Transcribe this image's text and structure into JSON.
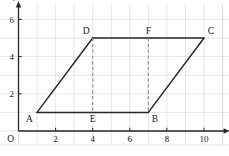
{
  "figure": {
    "axes": {
      "x_label": "x",
      "y_label": "y",
      "origin_label": "O",
      "x_ticks": [
        "2",
        "4",
        "6",
        "8",
        "10"
      ],
      "y_ticks": [
        "2",
        "4",
        "6"
      ],
      "x_tick_values": [
        2,
        4,
        6,
        8,
        10
      ],
      "y_tick_values": [
        2,
        4,
        6
      ],
      "x_range": [
        0,
        11.3
      ],
      "y_range": [
        0,
        6.8
      ],
      "grid": true,
      "grid_step": 1,
      "grid_color": "#cfcfcf",
      "axis_color": "#262626"
    },
    "vertices": [
      {
        "name": "A",
        "x": 1,
        "y": 1,
        "label": "A",
        "label_pos": "below-left"
      },
      {
        "name": "B",
        "x": 7,
        "y": 1,
        "label": "B",
        "label_pos": "below-right"
      },
      {
        "name": "C",
        "x": 10,
        "y": 5,
        "label": "C",
        "label_pos": "above-right"
      },
      {
        "name": "D",
        "x": 4,
        "y": 5,
        "label": "D",
        "label_pos": "above-left"
      },
      {
        "name": "E",
        "x": 4,
        "y": 1,
        "label": "E",
        "label_pos": "below"
      },
      {
        "name": "F",
        "x": 7,
        "y": 5,
        "label": "F",
        "label_pos": "above"
      }
    ],
    "solid_edges": [
      {
        "from": "A",
        "to": "B"
      },
      {
        "from": "B",
        "to": "C"
      },
      {
        "from": "C",
        "to": "D"
      },
      {
        "from": "D",
        "to": "A"
      }
    ],
    "dashed_segments": [
      {
        "from": "D",
        "to": "E"
      },
      {
        "from": "F",
        "to": "B"
      }
    ],
    "shape_color": "#262626",
    "dashed_color": "#8a8a8a"
  },
  "chart_data": {
    "type": "scatter",
    "xlabel": "x",
    "ylabel": "y",
    "xlim": [
      0,
      11.3
    ],
    "ylim": [
      0,
      6.8
    ],
    "grid": true,
    "x_ticks": [
      2,
      4,
      6,
      8,
      10
    ],
    "y_ticks": [
      2,
      4,
      6
    ],
    "series": [
      {
        "name": "Parallelogram ABCD (solid outline)",
        "x": [
          1,
          7,
          10,
          4,
          1
        ],
        "y": [
          1,
          1,
          5,
          5,
          1
        ],
        "style": "solid"
      },
      {
        "name": "Altitude DE (dashed)",
        "x": [
          4,
          4
        ],
        "y": [
          5,
          1
        ],
        "style": "dashed"
      },
      {
        "name": "Altitude FB (dashed)",
        "x": [
          7,
          7
        ],
        "y": [
          5,
          1
        ],
        "style": "dashed"
      }
    ],
    "annotations": [
      {
        "text": "A",
        "x": 1,
        "y": 1
      },
      {
        "text": "B",
        "x": 7,
        "y": 1
      },
      {
        "text": "C",
        "x": 10,
        "y": 5
      },
      {
        "text": "D",
        "x": 4,
        "y": 5
      },
      {
        "text": "E",
        "x": 4,
        "y": 1
      },
      {
        "text": "F",
        "x": 7,
        "y": 5
      },
      {
        "text": "O",
        "x": 0,
        "y": 0
      }
    ]
  }
}
